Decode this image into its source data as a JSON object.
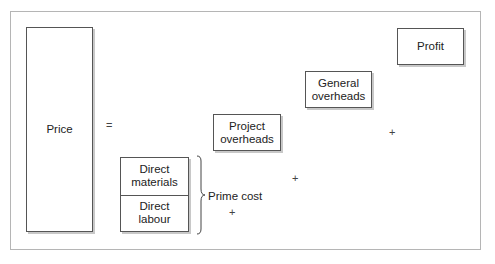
{
  "diagram": {
    "type": "cost-build-up",
    "price_label": "Price",
    "equals": "=",
    "components": {
      "direct_materials": "Direct\nmaterials",
      "direct_labour": "Direct\nlabour",
      "project_overheads": "Project\noverheads",
      "general_overheads": "General\noverheads",
      "profit": "Profit"
    },
    "brace_label": "Prime cost",
    "plus": "+"
  }
}
